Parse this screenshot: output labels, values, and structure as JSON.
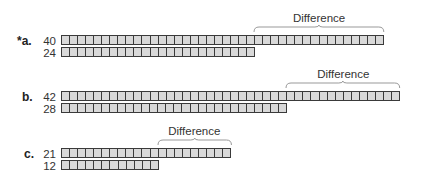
{
  "cell_width": 8.05,
  "bar_left": 61,
  "colors": {
    "cell_fill": "#d9d9d9",
    "cell_border": "#3a3a3a",
    "brace": "#999999"
  },
  "problems": [
    {
      "label": "*a.",
      "diff_label": "Difference",
      "top": {
        "value": 40,
        "text": "40",
        "y": 35
      },
      "bottom": {
        "value": 24,
        "text": "24",
        "y": 47
      },
      "diff_label_y": 12,
      "brace_y": 25
    },
    {
      "label": "b.",
      "diff_label": "Difference",
      "top": {
        "value": 42,
        "text": "42",
        "y": 91
      },
      "bottom": {
        "value": 28,
        "text": "28",
        "y": 103
      },
      "diff_label_y": 68,
      "brace_y": 81
    },
    {
      "label": "c.",
      "diff_label": "Difference",
      "top": {
        "value": 21,
        "text": "21",
        "y": 148
      },
      "bottom": {
        "value": 12,
        "text": "12",
        "y": 160
      },
      "diff_label_y": 125,
      "brace_y": 138
    }
  ]
}
